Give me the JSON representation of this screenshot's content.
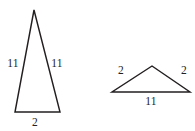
{
  "figure": {
    "background_color": "#ffffff",
    "stroke_color": "#231f20",
    "text_color": "#231f20",
    "width": 195,
    "height": 131
  },
  "chart_data": {
    "type": "diagram",
    "title": "",
    "subtitle": "",
    "xlabel": "",
    "ylabel": "",
    "grid": false,
    "legend": null,
    "shapes": [
      {
        "name": "tall-isosceles-triangle",
        "position": "left",
        "vertices": [
          [
            34,
            10
          ],
          [
            60,
            112
          ],
          [
            15,
            112
          ]
        ],
        "side_labels": {
          "left_leg": "11",
          "right_leg": "11",
          "base": "2"
        },
        "labels_ordered": [
          "11",
          "11",
          "2"
        ]
      },
      {
        "name": "flat-isosceles-triangle",
        "position": "right",
        "vertices": [
          [
            152,
            66
          ],
          [
            190,
            92
          ],
          [
            112,
            92
          ]
        ],
        "side_labels": {
          "left_leg": "2",
          "right_leg": "2",
          "base": "11"
        },
        "labels_ordered": [
          "2",
          "2",
          "11"
        ]
      }
    ]
  }
}
